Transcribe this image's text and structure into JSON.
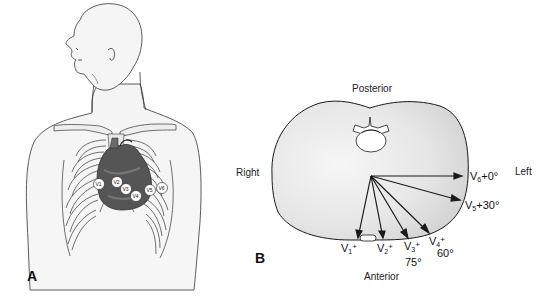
{
  "figure": {
    "panel_a": {
      "letter": "A",
      "description": "Anterior chest with heart and precordial electrode positions",
      "electrodes": [
        "V1",
        "V2",
        "V3",
        "V4",
        "V5",
        "V6"
      ]
    },
    "panel_b": {
      "letter": "B",
      "description": "Horizontal cross-section of thorax showing precordial lead axes",
      "orientation": {
        "posterior": "Posterior",
        "anterior": "Anterior",
        "right": "Right",
        "left": "Left"
      },
      "leads": [
        {
          "name": "V",
          "sub": "1",
          "sign": "+",
          "angle": ""
        },
        {
          "name": "V",
          "sub": "2",
          "sign": "+",
          "angle": ""
        },
        {
          "name": "V",
          "sub": "3",
          "sign": "+",
          "angle": "75°"
        },
        {
          "name": "V",
          "sub": "4",
          "sign": "+",
          "angle": "60°"
        },
        {
          "name": "V",
          "sub": "5",
          "sign": "+",
          "angle": "30°"
        },
        {
          "name": "V",
          "sub": "6",
          "sign": "+",
          "angle": "0°"
        }
      ]
    }
  },
  "colors": {
    "line": "#1a1a1a",
    "body_fill": "#e9e9e9",
    "heart_dark": "#4a4a4a",
    "heart_mid": "#6b6b6b",
    "electrode_fill": "#ffffff"
  }
}
